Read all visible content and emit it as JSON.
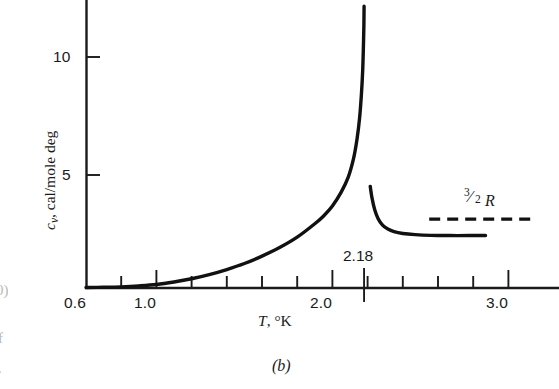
{
  "figure": {
    "caption": "(b)",
    "edge_fragments": [
      "0)",
      "f",
      "."
    ]
  },
  "chart_data": {
    "type": "line",
    "title": "",
    "subtitle": "",
    "xlabel": "T, °K",
    "ylabel": "cᵥ, cal/mole deg",
    "ylabel_parts": {
      "symbol": "c",
      "subscript": "v",
      "rest": ", cal/mole deg"
    },
    "xlim": [
      0.6,
      3.05
    ],
    "ylim": [
      0,
      12.2
    ],
    "grid": false,
    "legend": null,
    "xticks_major": [
      0.6,
      1.0,
      2.0,
      3.0
    ],
    "xticklabels_major": [
      "0.6",
      "1.0",
      "2.0",
      "3.0"
    ],
    "xticks_minor": [
      0.8,
      1.2,
      1.4,
      1.6,
      1.8,
      2.2,
      2.4,
      2.6,
      2.8
    ],
    "yticks": [
      5,
      10
    ],
    "yticklabels": [
      "5",
      "10"
    ],
    "annotations": [
      {
        "name": "lambda-point",
        "text": "2.18",
        "x": 2.18,
        "y": 0
      },
      {
        "name": "three-halves-r",
        "text": "3/2 R",
        "numerator": "3",
        "denominator": "2",
        "symbol": "R",
        "value": 2.98
      }
    ],
    "series": [
      {
        "name": "c_v below lambda point (He I)",
        "style": "solid",
        "points": [
          [
            0.6,
            0.02
          ],
          [
            0.7,
            0.03
          ],
          [
            0.8,
            0.05
          ],
          [
            0.9,
            0.09
          ],
          [
            1.0,
            0.15
          ],
          [
            1.1,
            0.26
          ],
          [
            1.2,
            0.4
          ],
          [
            1.3,
            0.58
          ],
          [
            1.4,
            0.8
          ],
          [
            1.5,
            1.06
          ],
          [
            1.6,
            1.38
          ],
          [
            1.7,
            1.75
          ],
          [
            1.8,
            2.2
          ],
          [
            1.9,
            2.78
          ],
          [
            1.95,
            3.12
          ],
          [
            2.0,
            3.55
          ],
          [
            2.05,
            4.15
          ],
          [
            2.09,
            4.8
          ],
          [
            2.12,
            5.6
          ],
          [
            2.14,
            6.45
          ],
          [
            2.155,
            7.4
          ],
          [
            2.165,
            8.4
          ],
          [
            2.172,
            9.4
          ],
          [
            2.176,
            10.4
          ],
          [
            2.179,
            11.4
          ],
          [
            2.18,
            12.2
          ]
        ]
      },
      {
        "name": "c_v above lambda point (He II)",
        "style": "solid",
        "points": [
          [
            2.215,
            4.4
          ],
          [
            2.225,
            3.9
          ],
          [
            2.24,
            3.4
          ],
          [
            2.26,
            3.0
          ],
          [
            2.285,
            2.72
          ],
          [
            2.315,
            2.55
          ],
          [
            2.35,
            2.44
          ],
          [
            2.4,
            2.36
          ],
          [
            2.47,
            2.31
          ],
          [
            2.56,
            2.28
          ],
          [
            2.67,
            2.27
          ],
          [
            2.78,
            2.27
          ],
          [
            2.87,
            2.27
          ]
        ]
      },
      {
        "name": "3/2 R classical limit",
        "style": "dashed",
        "points": [
          [
            2.55,
            2.98
          ],
          [
            3.15,
            2.98
          ]
        ]
      }
    ]
  }
}
